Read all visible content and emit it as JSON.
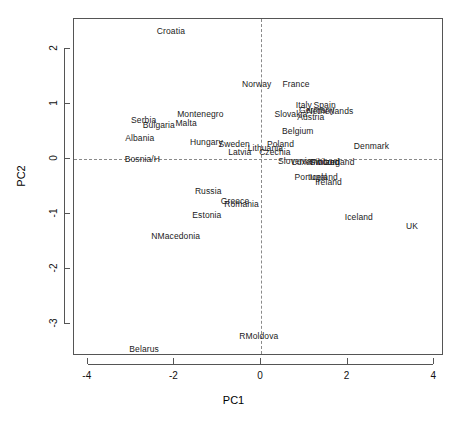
{
  "chart_data": {
    "type": "scatter",
    "title": "",
    "xlabel": "PC1",
    "ylabel": "PC2",
    "xlim": [
      -4.33,
      4.23
    ],
    "ylim": [
      -3.58,
      2.55
    ],
    "xticks": [
      -4,
      -2,
      0,
      2,
      4
    ],
    "yticks": [
      2,
      1,
      0,
      -1,
      -2,
      -3
    ],
    "xticklabels": [
      "-4",
      "-2",
      "0",
      "2",
      "4"
    ],
    "yticklabels": [
      "2",
      "1",
      "0",
      "-1",
      "-2",
      "-3"
    ],
    "grid": false,
    "legend": "none",
    "reference_lines": {
      "vertical_x": 0,
      "horizontal_y": 0,
      "style": "dashed"
    },
    "labels_only": true,
    "points": [
      {
        "label": "Croatia",
        "x": -2.08,
        "y": 2.33
      },
      {
        "label": "Norway",
        "x": -0.1,
        "y": 1.36
      },
      {
        "label": "France",
        "x": 0.81,
        "y": 1.36
      },
      {
        "label": "Italy",
        "x": 0.99,
        "y": 0.98
      },
      {
        "label": "Spain",
        "x": 1.47,
        "y": 0.98
      },
      {
        "label": "Germany",
        "x": 1.29,
        "y": 0.89
      },
      {
        "label": "Netherlands",
        "x": 1.59,
        "y": 0.87
      },
      {
        "label": "Slovakia",
        "x": 0.69,
        "y": 0.82
      },
      {
        "label": "Austria",
        "x": 1.15,
        "y": 0.76
      },
      {
        "label": "Montenegro",
        "x": -1.4,
        "y": 0.82
      },
      {
        "label": "Serbia",
        "x": -2.71,
        "y": 0.71
      },
      {
        "label": "Bulgaria",
        "x": -2.36,
        "y": 0.62
      },
      {
        "label": "Malta",
        "x": -1.73,
        "y": 0.65
      },
      {
        "label": "Belgium",
        "x": 0.85,
        "y": 0.51
      },
      {
        "label": "Albania",
        "x": -2.8,
        "y": 0.38
      },
      {
        "label": "Hungary",
        "x": -1.26,
        "y": 0.31
      },
      {
        "label": "Sweden",
        "x": -0.62,
        "y": 0.27
      },
      {
        "label": "Poland",
        "x": 0.45,
        "y": 0.27
      },
      {
        "label": "Lithuania",
        "x": 0.1,
        "y": 0.2
      },
      {
        "label": "Denmark",
        "x": 2.55,
        "y": 0.24
      },
      {
        "label": "Latvia",
        "x": -0.49,
        "y": 0.13
      },
      {
        "label": "Czechia",
        "x": 0.32,
        "y": 0.13
      },
      {
        "label": "Bosnia/H",
        "x": -2.74,
        "y": 0.0
      },
      {
        "label": "Slovenia",
        "x": 0.78,
        "y": -0.04
      },
      {
        "label": "Luxembourg",
        "x": 1.27,
        "y": -0.05
      },
      {
        "label": "Switzerland",
        "x": 1.64,
        "y": -0.05
      },
      {
        "label": "Finland",
        "x": 1.48,
        "y": -0.05
      },
      {
        "label": "Portugal",
        "x": 1.15,
        "y": -0.33
      },
      {
        "label": "Iceland-d",
        "x": 1.45,
        "y": -0.33
      },
      {
        "label": "Ireland",
        "x": 1.56,
        "y": -0.42
      },
      {
        "label": "Russia",
        "x": -1.22,
        "y": -0.58
      },
      {
        "label": "Greece",
        "x": -0.6,
        "y": -0.76
      },
      {
        "label": "Romania",
        "x": -0.45,
        "y": -0.82
      },
      {
        "label": "Estonia",
        "x": -1.25,
        "y": -1.02
      },
      {
        "label": "Iceland",
        "x": 2.26,
        "y": -1.05
      },
      {
        "label": "UK",
        "x": 3.49,
        "y": -1.22
      },
      {
        "label": "NMacedonia",
        "x": -1.97,
        "y": -1.4
      },
      {
        "label": "RMoldova",
        "x": -0.05,
        "y": -3.22
      },
      {
        "label": "Belarus",
        "x": -2.7,
        "y": -3.45
      }
    ]
  }
}
